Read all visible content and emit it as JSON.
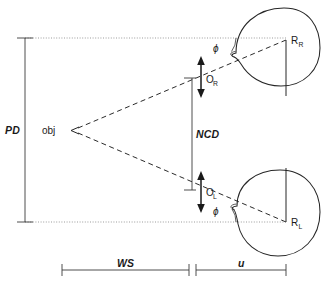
{
  "diagram": {
    "background_color": "#ffffff",
    "line_color": "#262626",
    "dotted_color": "#8a8a8a",
    "labels": {
      "pd": "PD",
      "obj": "obj",
      "ncd": "NCD",
      "o_right_base": "O",
      "o_right_sub": "R",
      "o_left_base": "O",
      "o_left_sub": "L",
      "r_right_base": "R",
      "r_right_sub": "R",
      "r_left_base": "R",
      "r_left_sub": "L",
      "phi_top": "ϕ",
      "phi_bottom": "ϕ",
      "ws": "WS",
      "u": "u"
    },
    "dimensions": {
      "pd": {
        "label": "PD",
        "orientation": "vertical",
        "x": 25,
        "y_top": 38,
        "y_bottom": 222
      },
      "ncd": {
        "label": "NCD",
        "orientation": "vertical",
        "x": 192,
        "y_top": 78,
        "y_bottom": 190
      },
      "ws": {
        "label": "WS",
        "orientation": "horizontal",
        "y": 270,
        "x_start": 62,
        "x_end": 189
      },
      "u": {
        "label": "u",
        "orientation": "horizontal",
        "y": 270,
        "x_start": 196,
        "x_end": 286
      }
    },
    "points": {
      "obj": {
        "label": "obj",
        "x": 70,
        "y": 130
      },
      "r_right": {
        "label": "R_R",
        "x": 286,
        "y": 40
      },
      "r_left": {
        "label": "R_L",
        "x": 286,
        "y": 222
      },
      "o_right": {
        "label": "O_R",
        "x": 192,
        "y": 78
      },
      "o_left": {
        "label": "O_L",
        "x": 192,
        "y": 190
      }
    },
    "angles": {
      "phi_top": {
        "label": "ϕ",
        "vertex_x": 233,
        "vertex_y": 56,
        "x": 215,
        "y": 50
      },
      "phi_bottom": {
        "label": "ϕ",
        "vertex_x": 233,
        "vertex_y": 206,
        "x": 215,
        "y": 214
      }
    }
  }
}
